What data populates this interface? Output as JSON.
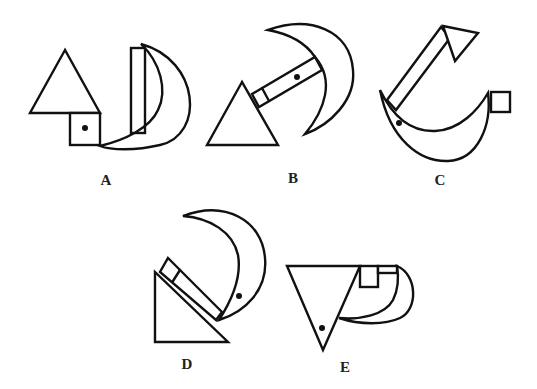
{
  "options": [
    {
      "id": "A",
      "label": "A",
      "shapes": [
        "triangle",
        "square-with-dot",
        "bar",
        "crescent"
      ]
    },
    {
      "id": "B",
      "label": "B",
      "shapes": [
        "triangle",
        "bar-with-dot",
        "crescent"
      ]
    },
    {
      "id": "C",
      "label": "C",
      "shapes": [
        "arrow-triangle",
        "bar",
        "crescent-with-dot",
        "square"
      ]
    },
    {
      "id": "D",
      "label": "D",
      "shapes": [
        "right-triangle",
        "bar",
        "crescent-with-dot"
      ]
    },
    {
      "id": "E",
      "label": "E",
      "shapes": [
        "inverted-triangle-with-dot",
        "square",
        "bar",
        "crescent"
      ]
    }
  ],
  "colors": {
    "stroke": "#111111",
    "background": "#ffffff"
  }
}
